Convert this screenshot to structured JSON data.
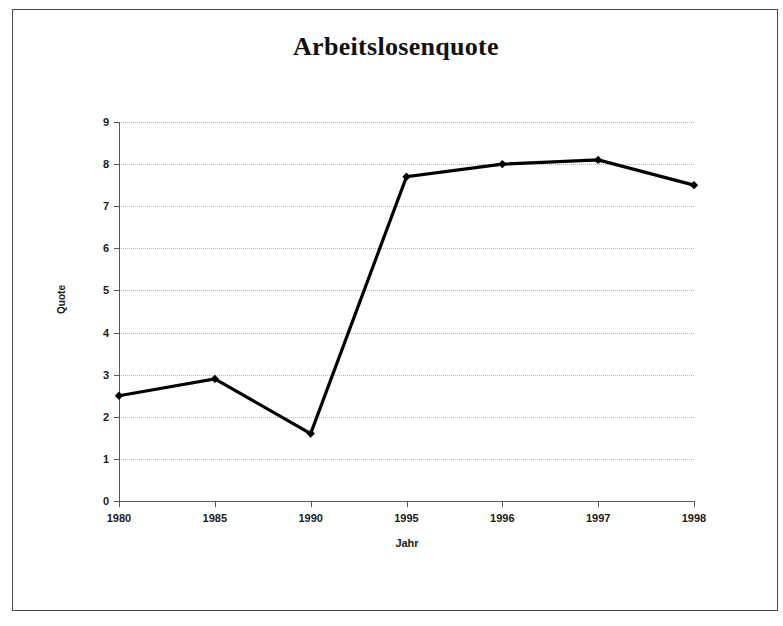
{
  "chart_data": {
    "type": "line",
    "title": "Arbeitslosenquote",
    "xlabel": "Jahr",
    "ylabel": "Quote",
    "categories": [
      "1980",
      "1985",
      "1990",
      "1995",
      "1996",
      "1997",
      "1998"
    ],
    "values": [
      2.5,
      2.9,
      1.6,
      7.7,
      8.0,
      8.1,
      7.5
    ],
    "series": [
      {
        "name": "Arbeitslosenquote",
        "values": [
          2.5,
          2.9,
          1.6,
          7.7,
          8.0,
          8.1,
          7.5
        ]
      }
    ],
    "ylim": [
      0,
      9
    ],
    "ytick_labels": [
      "0",
      "1",
      "2",
      "3",
      "4",
      "5",
      "6",
      "7",
      "8",
      "9"
    ],
    "ytick_values": [
      0,
      1,
      2,
      3,
      4,
      5,
      6,
      7,
      8,
      9
    ],
    "grid": true,
    "grid_axis": "y",
    "grid_style": "dotted",
    "legend": false,
    "legend_position": "none",
    "marker": "diamond",
    "colors": {
      "line": "#000000",
      "marker": "#000000",
      "grid": "#b4b4b4",
      "axis": "#555555",
      "text": "#1a1a1a",
      "frame": "#4a4a4a",
      "background": "#ffffff"
    }
  }
}
